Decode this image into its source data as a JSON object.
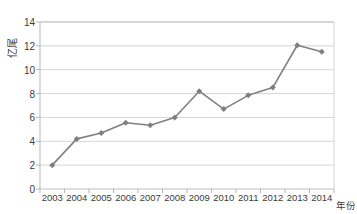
{
  "chart_data": {
    "type": "line",
    "title": "",
    "xlabel": "年份",
    "ylabel": "亿尾",
    "categories": [
      "2003",
      "2004",
      "2005",
      "2006",
      "2007",
      "2008",
      "2009",
      "2010",
      "2011",
      "2012",
      "2013",
      "2014"
    ],
    "values": [
      2.0,
      4.2,
      4.7,
      5.55,
      5.35,
      6.0,
      8.2,
      6.7,
      7.85,
      8.5,
      12.05,
      11.5
    ],
    "series": [
      {
        "name": "",
        "values": [
          2.0,
          4.2,
          4.7,
          5.55,
          5.35,
          6.0,
          8.2,
          6.7,
          7.85,
          8.5,
          12.05,
          11.5
        ]
      }
    ],
    "ylim": [
      0,
      14
    ],
    "yticks": [
      0,
      2,
      4,
      6,
      8,
      10,
      12,
      14
    ],
    "ytick_labels": [
      "0",
      "2",
      "4",
      "6",
      "8",
      "10",
      "12",
      "14"
    ],
    "grid": "horizontal",
    "legend": "none",
    "marker": "diamond",
    "line_color": "#808080",
    "marker_color": "#7f7f7f",
    "grid_color": "#d0d0d0",
    "axis_color": "#b5b5b5",
    "text_color": "#3b3b3b",
    "background": "#ffffff"
  }
}
